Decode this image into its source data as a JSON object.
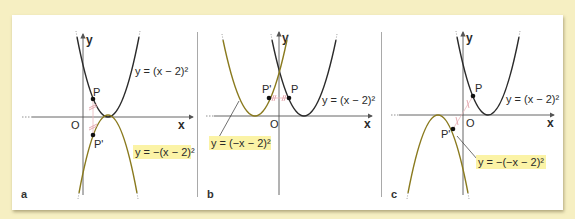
{
  "figure": {
    "colors": {
      "background": "#f6efc2",
      "card": "#ffffff",
      "original_curve": "#2b2b2b",
      "transformed_curve": "#8a7a1e",
      "label_highlight": "#fbf3a6",
      "tick_marks": "#e2a0a8",
      "axes": "#555555"
    },
    "panels": [
      {
        "letter": "a",
        "origin_label": "O",
        "x_axis_label": "x",
        "y_axis_label": "y",
        "point_label": "P",
        "image_point_label": "P'",
        "original_equation": "y = (x − 2)²",
        "transformed_equation": "y = −(x − 2)²",
        "transformation": "reflection in x-axis"
      },
      {
        "letter": "b",
        "origin_label": "O",
        "x_axis_label": "x",
        "y_axis_label": "y",
        "point_label": "P",
        "image_point_label": "P'",
        "original_equation": "y = (x − 2)²",
        "transformed_equation": "y = (−x − 2)²",
        "transformation": "reflection in y-axis"
      },
      {
        "letter": "c",
        "origin_label": "O",
        "x_axis_label": "x",
        "y_axis_label": "y",
        "point_label": "P",
        "image_point_label": "P'",
        "original_equation": "y = (x − 2)²",
        "transformed_equation": "y = −(−x − 2)²",
        "transformation": "point reflection in origin"
      }
    ]
  }
}
